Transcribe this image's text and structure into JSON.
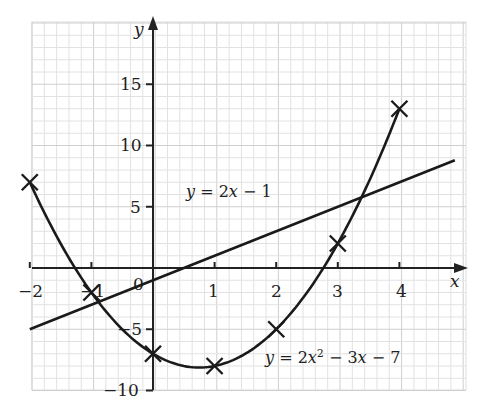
{
  "chart_data": {
    "type": "line",
    "title": "",
    "xlabel": "x",
    "ylabel": "y",
    "xlim": [
      -2,
      4.9
    ],
    "ylim": [
      -10,
      19.5
    ],
    "grid": true,
    "x_ticks": [
      -2,
      -1,
      0,
      1,
      2,
      3,
      4
    ],
    "x_tick_labels": [
      "−2",
      "−1",
      "0",
      "1",
      "2",
      "3",
      "4"
    ],
    "y_ticks": [
      15,
      10,
      5,
      -5,
      -10
    ],
    "y_tick_labels": [
      "15",
      "10",
      "5",
      "−5",
      "−10"
    ],
    "series": [
      {
        "name": "y = 2x² − 3x − 7",
        "kind": "curve",
        "marker": "cross",
        "x": [
          -2,
          -1,
          0,
          1,
          2,
          3,
          4
        ],
        "y": [
          7,
          -2,
          -7,
          -8,
          -5,
          2,
          13
        ]
      },
      {
        "name": "y = 2x − 1",
        "kind": "line",
        "x": [
          -2,
          4.9
        ],
        "y": [
          -5,
          8.8
        ]
      }
    ],
    "annotations": [
      {
        "text": "y = 2x − 1",
        "near": [
          1.8,
          6.5
        ]
      },
      {
        "text": "y = 2x² − 3x − 7",
        "near": [
          3.5,
          -7.5
        ]
      }
    ]
  },
  "labels": {
    "x_axis": "x",
    "y_axis": "y",
    "line_eq_y": "y",
    "line_eq_rest": " = 2",
    "line_eq_x": "x",
    "line_eq_tail": " − 1",
    "curve_eq_y": "y",
    "curve_eq_mid": " = 2",
    "curve_eq_x": "x",
    "curve_eq_sup": "2",
    "curve_eq_mid2": " − 3",
    "curve_eq_x2": "x",
    "curve_eq_tail": " − 7",
    "xt": [
      "−2",
      "−1",
      "0",
      "1",
      "2",
      "3",
      "4"
    ],
    "yt": [
      "15",
      "10",
      "5",
      "−5",
      "−10"
    ]
  }
}
